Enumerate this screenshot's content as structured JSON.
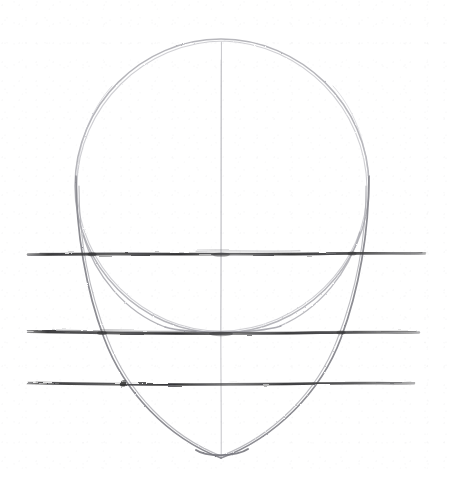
{
  "artwork": {
    "title": "Head Construction Sketch",
    "medium": "graphite pencil on white paper",
    "subject": "front-view human head proportion study",
    "canvas": {
      "width": 449,
      "height": 479,
      "background_color": "#ffffff"
    },
    "alt_text": "A light pencil drawing of a head shape: a large faint circle for the cranium with a tapering jaw ending in a pointed chin, a faint vertical center line, and three dark horizontal proportion guide lines crossing the whole page."
  },
  "palette": {
    "paper": "#ffffff",
    "faint_pencil": "#b9b9bd",
    "light_pencil": "#a0a0a6",
    "mid_pencil": "#8a8a90",
    "dark_pencil": "#4a4a4c",
    "guide_line": "#3b3b3d"
  },
  "construction": {
    "center_x": 221,
    "cranium_circle": {
      "name": "cranium-circle",
      "center_x": 222,
      "center_y": 186,
      "radius": 147,
      "top_y": 39,
      "bottom_y": 333,
      "left_x": 75,
      "right_x": 369,
      "stroke_color": "#b9b9bd",
      "stroke_width": 1.4
    },
    "jaw_outline": {
      "name": "jaw-outline",
      "left_start_x": 76,
      "right_start_x": 369,
      "start_y": 180,
      "chin_x": 221,
      "chin_y": 458,
      "stroke_color": "#9b9ba1",
      "stroke_width": 1.6
    },
    "center_line": {
      "name": "vertical-center-line",
      "x": 221,
      "top_y": 42,
      "bottom_y": 458,
      "stroke_color": "#c6c6ca",
      "stroke_width": 1.1
    }
  },
  "guide_lines": [
    {
      "id": "brow-eye-line",
      "label": "eye line",
      "y": 254,
      "x_start": 28,
      "x_end": 425,
      "thickness": 2.6,
      "color": "#3b3b3d"
    },
    {
      "id": "nose-line",
      "label": "nose line",
      "y": 333,
      "x_start": 28,
      "x_end": 419,
      "thickness": 2.5,
      "color": "#3b3b3d"
    },
    {
      "id": "mouth-line",
      "label": "mouth line",
      "y": 384,
      "x_start": 28,
      "x_end": 414,
      "thickness": 2.4,
      "color": "#3b3b3d"
    }
  ]
}
